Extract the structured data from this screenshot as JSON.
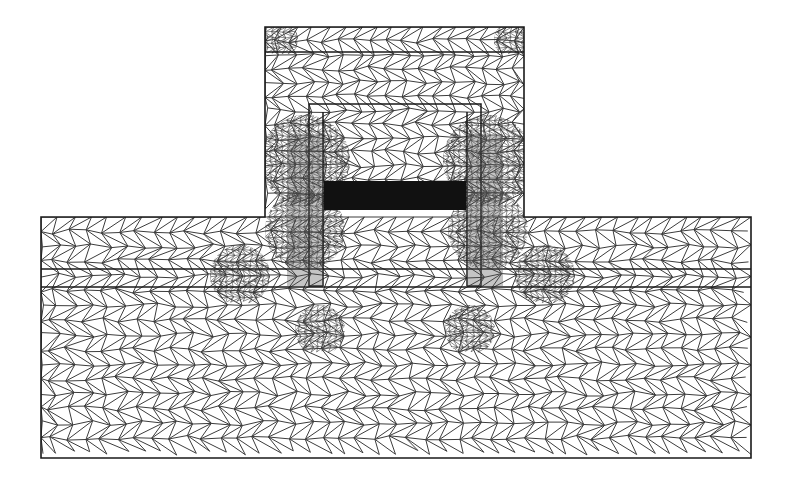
{
  "figure": {
    "type": "finite-element triangular mesh",
    "width": 790,
    "height": 480,
    "background": "#ffffff",
    "mesh_color": "#3c3c3c",
    "outline_color": "#1a1a1a",
    "dense_fill_color": "#111111"
  },
  "geometry": {
    "substrate": {
      "x": 41,
      "y": 217,
      "w": 710,
      "h": 241
    },
    "ridge": {
      "x": 265,
      "y": 27,
      "w": 259,
      "h": 190
    },
    "ridge_top_line_y": 52,
    "layer_lines_y": [
      269,
      287
    ],
    "inner_frame": {
      "x": 309,
      "y": 104,
      "w": 172,
      "h": 182
    },
    "inner_frame_offset": 14,
    "electrode_bar": {
      "x": 324,
      "y": 181,
      "w": 142,
      "h": 29
    }
  },
  "refinement_spots": [
    {
      "x": 305,
      "y": 160,
      "r": 45
    },
    {
      "x": 488,
      "y": 160,
      "r": 45
    },
    {
      "x": 305,
      "y": 230,
      "r": 40
    },
    {
      "x": 488,
      "y": 230,
      "r": 40
    },
    {
      "x": 240,
      "y": 275,
      "r": 30
    },
    {
      "x": 545,
      "y": 275,
      "r": 30
    },
    {
      "x": 320,
      "y": 330,
      "r": 25
    },
    {
      "x": 470,
      "y": 330,
      "r": 25
    },
    {
      "x": 280,
      "y": 40,
      "r": 18
    },
    {
      "x": 512,
      "y": 40,
      "r": 18
    }
  ]
}
